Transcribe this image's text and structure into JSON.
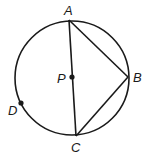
{
  "diagram": {
    "circle": {
      "cx": 72,
      "cy": 78,
      "r": 57,
      "center_label": "P"
    },
    "points": [
      {
        "label": "A",
        "x": 69,
        "y": 20
      },
      {
        "label": "B",
        "x": 128,
        "y": 77
      },
      {
        "label": "C",
        "x": 76,
        "y": 136
      },
      {
        "label": "D",
        "x": 21,
        "y": 103
      },
      {
        "label": "P",
        "x": 72,
        "y": 77
      }
    ],
    "segments": [
      [
        "A",
        "C"
      ],
      [
        "A",
        "B"
      ],
      [
        "B",
        "C"
      ]
    ],
    "labels": {
      "A": "A",
      "B": "B",
      "C": "C",
      "D": "D",
      "P": "P"
    },
    "stroke_color": "#1a1a1a"
  }
}
